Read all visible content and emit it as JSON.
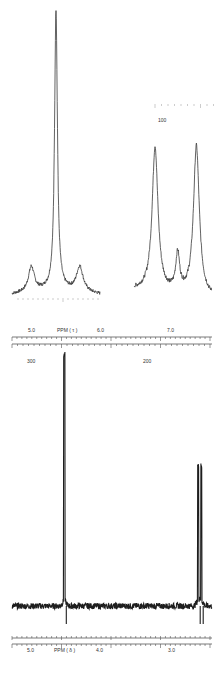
{
  "chart_data": [
    {
      "type": "line",
      "title": "",
      "panel": "top-left-expansion",
      "description": "Expanded 19F NMR multiplet (single dominant peak with side satellites)",
      "peaks": [
        {
          "position": 0.5,
          "relative_height": 0.27
        },
        {
          "position": 0.22,
          "relative_height": 0.06
        },
        {
          "position": 0.77,
          "relative_height": 0.06
        }
      ]
    },
    {
      "type": "line",
      "title": "",
      "panel": "top-right-expansion",
      "scale_label": "100",
      "description": "Expanded doublet with small central peak",
      "peaks": [
        {
          "position": 0.27,
          "relative_height": 0.85
        },
        {
          "position": 0.56,
          "relative_height": 0.22
        },
        {
          "position": 0.8,
          "relative_height": 0.88
        }
      ]
    },
    {
      "type": "line",
      "title": "",
      "panel": "bottom-full-spectrum",
      "xlabel_top": "PPM ( τ )",
      "xticks_top": [
        "5.0",
        "6.0",
        "7.0"
      ],
      "xlabel_bottom": "PPM ( δ )",
      "xticks_bottom": [
        "5.0",
        "4.0",
        "3.0"
      ],
      "scale_labels": [
        "300",
        "200"
      ],
      "xlim_delta": [
        5.3,
        2.7
      ],
      "peaks": [
        {
          "delta": 4.62,
          "relative_height": 1.0,
          "label": "strong singlet"
        },
        {
          "delta": 2.88,
          "relative_height": 0.55,
          "label": "doublet"
        },
        {
          "delta": 2.84,
          "relative_height": 0.55,
          "label": "doublet"
        }
      ]
    }
  ]
}
